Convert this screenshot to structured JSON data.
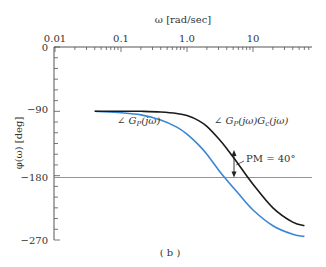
{
  "chart_data": {
    "type": "line",
    "title": "",
    "caption": "(b)",
    "xlabel": "ω [rad/sec]",
    "ylabel": "φ(ω) [deg]",
    "xscale": "log",
    "xlim": [
      0.01,
      80
    ],
    "ylim": [
      -270,
      0
    ],
    "x_ticks": [
      "0.01",
      "0.1",
      "1.0",
      "10"
    ],
    "y_ticks": [
      "0",
      "-90",
      "-180",
      "-270"
    ],
    "grid": false,
    "reference_line": {
      "y": -180
    },
    "series": [
      {
        "name": "∠ Gp(jω)",
        "color": "#3a86d4",
        "x": [
          0.04,
          0.1,
          0.2,
          0.4,
          0.7,
          1.0,
          1.5,
          2.0,
          3.0,
          4.0,
          6.0,
          10,
          20,
          40,
          60
        ],
        "y": [
          -90,
          -92,
          -95,
          -102,
          -112,
          -122,
          -137,
          -150,
          -172,
          -186,
          -205,
          -228,
          -250,
          -262,
          -265
        ]
      },
      {
        "name": "∠ Gp(jω)Gc(jω)",
        "color": "#1a1a1a",
        "x": [
          0.04,
          0.1,
          0.2,
          0.4,
          0.7,
          1.0,
          1.5,
          2.0,
          3.0,
          4.0,
          6.0,
          10,
          20,
          40,
          60
        ],
        "y": [
          -90,
          -90,
          -90,
          -91,
          -93,
          -96,
          -103,
          -111,
          -128,
          -142,
          -164,
          -192,
          -225,
          -245,
          -250
        ]
      }
    ],
    "annotations": [
      {
        "text": "∠ Gp(jω)",
        "near": "blue curve at ω≈0.2"
      },
      {
        "text": "∠ Gp(jω)Gc(jω)",
        "near": "black curve at ω≈3"
      },
      {
        "text": "PM = 40°",
        "at_x": 4.5
      }
    ]
  },
  "labels": {
    "xlabel": "ω [rad/sec]",
    "ylabel": "φ(ω) [deg]",
    "xt0": "0.01",
    "xt1": "0.1",
    "xt2": "1.0",
    "xt3": "10",
    "yt0": "0",
    "yt1": "−90",
    "yt2": "−180",
    "yt3": "−270",
    "gp": "∠ G",
    "gp_sub": "P",
    "gp_arg": "(jω)",
    "gpgc_a": "∠ G",
    "gpgc_sub1": "P",
    "gpgc_b": "(jω)G",
    "gpgc_sub2": "c",
    "gpgc_c": "(jω)",
    "pm": "PM = 40°",
    "caption": "( b )"
  }
}
